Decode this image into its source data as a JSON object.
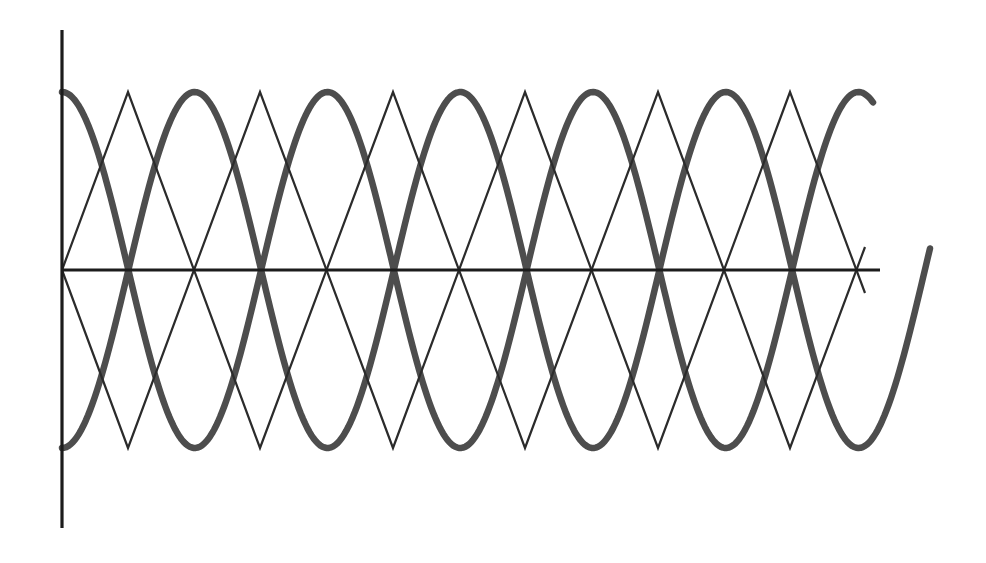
{
  "figure": {
    "title": "",
    "background_color": "#ffffff"
  },
  "axes": {
    "x_axis": {
      "name": "x-axis",
      "color": "#1c1c1c",
      "stroke_width": 3.2,
      "x_start": 62,
      "x_end": 880,
      "y": 270
    },
    "y_axis": {
      "name": "y-axis",
      "color": "#1c1c1c",
      "stroke_width": 3.2,
      "x": 62,
      "y_top": 30,
      "y_bottom": 528
    },
    "origin": {
      "x": 62,
      "y": 270
    },
    "ticks": [],
    "tick_labels": [],
    "grid": false,
    "axis_labels": {
      "x": "",
      "y": ""
    }
  },
  "chart_data": {
    "type": "line",
    "title": "",
    "subtitle": "",
    "xlabel": "",
    "ylabel": "",
    "grid": false,
    "legend": null,
    "legend_position": "none",
    "xlim": [
      0,
      3.08
    ],
    "ylim": [
      -1,
      1
    ],
    "x_unit": "periods",
    "sample_points_per_series": 400,
    "geometry": {
      "origin_px": [
        62,
        270
      ],
      "amplitude_px": 178,
      "period_px": 265.5,
      "x_axis_end_px": 880,
      "thick_curve_end_px": 873,
      "thick_curve_end_px_lower": 930
    },
    "series": [
      {
        "name": "cosine-thick-positive",
        "kind": "cosine",
        "phase": 0,
        "amplitude": 1,
        "period": 1,
        "color": "#4d4d4d",
        "stroke_width": 6.5,
        "x_start_px": 62,
        "x_end_px": 873,
        "start_value": 1,
        "extrema_px": [
          [
            265,
            53
          ],
          [
            530,
            487
          ],
          [
            795,
            53
          ]
        ],
        "description": "Thick cosine starting at +1 at the y-axis"
      },
      {
        "name": "cosine-thick-negative",
        "kind": "cosine",
        "phase": 0.5,
        "amplitude": 1,
        "period": 1,
        "color": "#4d4d4d",
        "stroke_width": 6.5,
        "x_start_px": 62,
        "x_end_px": 930,
        "start_value": -1,
        "extrema_px": [
          [
            265,
            487
          ],
          [
            530,
            53
          ],
          [
            795,
            487
          ]
        ],
        "description": "Thick inverted cosine starting at -1 at the y-axis"
      },
      {
        "name": "triangle-thin-rising",
        "kind": "triangle",
        "phase": 0,
        "amplitude": 1,
        "period": 1,
        "color": "#2b2b2b",
        "stroke_width": 2.2,
        "x_start_px": 62,
        "x_end_px": 865,
        "start_value": 0,
        "vertices_px": [
          [
            62,
            270
          ],
          [
            128,
            92
          ],
          [
            260,
            448
          ],
          [
            393,
            92
          ],
          [
            525,
            448
          ],
          [
            658,
            92
          ],
          [
            790,
            448
          ],
          [
            865,
            247
          ]
        ],
        "description": "Thin triangle wave starting at 0 and rising first"
      },
      {
        "name": "triangle-thin-falling",
        "kind": "triangle",
        "phase": 0.5,
        "amplitude": 1,
        "period": 1,
        "color": "#2b2b2b",
        "stroke_width": 2.2,
        "x_start_px": 62,
        "x_end_px": 865,
        "start_value": 0,
        "vertices_px": [
          [
            62,
            270
          ],
          [
            128,
            448
          ],
          [
            260,
            92
          ],
          [
            393,
            448
          ],
          [
            525,
            92
          ],
          [
            658,
            448
          ],
          [
            790,
            92
          ],
          [
            865,
            293
          ]
        ],
        "description": "Thin triangle wave starting at 0 and falling first"
      }
    ],
    "intersections_px": [
      [
        132,
        163
      ],
      [
        265,
        388
      ],
      [
        400,
        163
      ],
      [
        530,
        388
      ],
      [
        665,
        163
      ],
      [
        800,
        388
      ]
    ]
  }
}
